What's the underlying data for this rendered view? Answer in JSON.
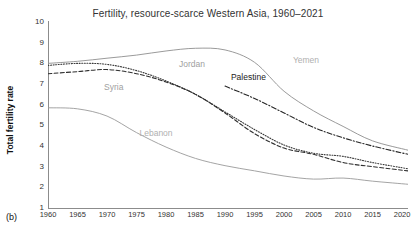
{
  "panel": {
    "label": "(b)"
  },
  "chart_data": {
    "type": "line",
    "title": "Fertility, resource-scarce Western Asia, 1960–2021",
    "xlabel": "",
    "ylabel": "Total fertility rate",
    "xlim": [
      1960,
      2021
    ],
    "ylim": [
      1,
      10
    ],
    "grid": false,
    "legend_position": "inline-labels",
    "yticks": [
      10,
      9,
      8,
      7,
      6,
      5,
      4,
      3,
      2,
      1
    ],
    "xticks": [
      1960,
      1965,
      1970,
      1975,
      1980,
      1985,
      1990,
      1995,
      2000,
      2005,
      2010,
      2015,
      2020
    ],
    "x": [
      1960,
      1965,
      1970,
      1975,
      1980,
      1985,
      1990,
      1995,
      2000,
      2005,
      2010,
      2015,
      2021
    ],
    "series": [
      {
        "name": "Yemen",
        "style": "solid",
        "color": "#8f8f8f",
        "label_color": "#b0b0b0",
        "values": [
          7.95,
          8.05,
          8.2,
          8.35,
          8.55,
          8.68,
          8.6,
          8.0,
          6.6,
          5.65,
          4.9,
          4.2,
          3.75
        ]
      },
      {
        "name": "Jordan",
        "style": "dotted",
        "color": "#3a3a3a",
        "label_color": "#a0a0a0",
        "values": [
          7.85,
          7.95,
          7.9,
          7.6,
          7.1,
          6.45,
          5.6,
          4.75,
          4.0,
          3.6,
          3.45,
          3.15,
          2.85
        ]
      },
      {
        "name": "Syria",
        "style": "dashed",
        "color": "#2e2e2e",
        "label_color": "#a0a0a0",
        "values": [
          7.45,
          7.55,
          7.65,
          7.45,
          7.05,
          6.45,
          5.55,
          4.55,
          3.85,
          3.55,
          3.15,
          2.95,
          2.75
        ]
      },
      {
        "name": "Palestine",
        "style": "dashdot",
        "color": "#262626",
        "label_color": "#222222",
        "values": [
          null,
          null,
          null,
          null,
          null,
          null,
          6.85,
          6.25,
          5.55,
          4.85,
          4.35,
          3.95,
          3.55
        ]
      },
      {
        "name": "Lebanon",
        "style": "solid",
        "color": "#9a9a9a",
        "label_color": "#b0b0b0",
        "values": [
          5.8,
          5.75,
          5.4,
          4.6,
          3.9,
          3.35,
          3.0,
          2.75,
          2.5,
          2.35,
          2.4,
          2.25,
          2.1
        ]
      }
    ],
    "inline_labels": [
      {
        "text": "Jordan",
        "x": 1982.2,
        "y": 7.85
      },
      {
        "text": "Yemen",
        "x": 2001.5,
        "y": 8.05
      },
      {
        "text": "Syria",
        "x": 1969.5,
        "y": 6.75
      },
      {
        "text": "Palestine",
        "x": 1991.0,
        "y": 7.25
      },
      {
        "text": "Lebanon",
        "x": 1975.5,
        "y": 4.55
      }
    ]
  }
}
